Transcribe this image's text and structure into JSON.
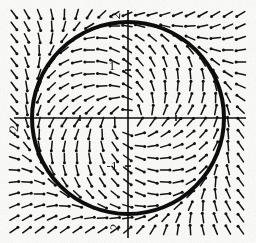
{
  "figure": {
    "title": "",
    "caption": "",
    "kind": "phase-portrait-direction-field",
    "background_color": "#fdfdfb",
    "ink_color": "#101010"
  },
  "axes": {
    "x_axis_label": "",
    "y_axis_label": "",
    "origin_label": "",
    "xlim": [
      -2.65,
      2.65
    ],
    "ylim": [
      -2.55,
      2.55
    ],
    "ticks": [
      {
        "id": "y-top",
        "text": "2",
        "value": 2,
        "axis": "y",
        "x_px": 120,
        "y_px": 16,
        "rotation": -88
      },
      {
        "id": "y-one",
        "text": "1",
        "value": 1,
        "axis": "y",
        "x_px": 112,
        "y_px": 70,
        "rotation": 0
      },
      {
        "id": "y-neg1",
        "text": "-1",
        "value": -1,
        "axis": "y",
        "x_px": 112,
        "y_px": 170,
        "rotation": 0
      },
      {
        "id": "y-bottom",
        "text": "2",
        "value": -2,
        "axis": "y",
        "x_px": 119,
        "y_px": 228,
        "rotation": -80
      },
      {
        "id": "x-left",
        "text": "-2",
        "value": -2,
        "axis": "x",
        "x_px": 18,
        "y_px": 131,
        "rotation": -88
      }
    ],
    "tick_mark_values_x": [
      -2,
      -1,
      1,
      2
    ],
    "tick_mark_values_y": [
      -2,
      -1,
      1,
      2
    ]
  },
  "chart_data": {
    "type": "scatter",
    "subtype": "vector-field-with-limit-cycle",
    "title": "",
    "xlabel": "",
    "ylabel": "",
    "xlim": [
      -2.65,
      2.65
    ],
    "ylim": [
      -2.55,
      2.55
    ],
    "grid": false,
    "legend": null,
    "system": {
      "description": "Planar autonomous system with unstable spiral at origin and a stable circular limit cycle of radius 2",
      "r_dot": "r(1 - r^2/4)",
      "theta_dot": "1",
      "rotation_sense": "counterclockwise"
    },
    "limit_cycle": {
      "shape": "circle",
      "center": [
        0,
        0
      ],
      "radius": 2,
      "stability": "stable",
      "stroke_width_px": 4,
      "color": "#0d0d0d",
      "center_px": [
        128,
        118
      ],
      "radius_px": 96
    },
    "fixed_points": [
      {
        "x": 0,
        "y": 0,
        "type": "unstable-spiral",
        "label": ""
      }
    ],
    "field": {
      "glyph": "arrow-segment",
      "normalized": true,
      "grid_nx": 19,
      "grid_ny": 19,
      "x_start_px": 14,
      "y_start_px": 14,
      "x_step_px": 12.6,
      "y_step_px": 12.0,
      "arrow_length_px": 9.5,
      "color": "#121212",
      "stroke_width_px": 1.5,
      "head_radius_px": 1.5
    },
    "axis_lines": {
      "color": "#0f0f0f",
      "stroke_width_px": 1.6,
      "x_axis_y_px": 118,
      "y_axis_x_px": 128,
      "x_axis_extent_px": [
        14,
        246
      ],
      "y_axis_extent_px": [
        10,
        238
      ]
    }
  }
}
